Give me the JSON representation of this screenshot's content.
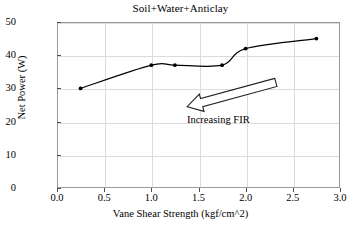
{
  "chart_data": {
    "type": "line",
    "title": "Soil+Water+Anticlay",
    "xlabel": "Vane Shear Strength (kgf/cm^2)",
    "ylabel": "Net Power (W)",
    "xlim": [
      0.0,
      3.0
    ],
    "ylim": [
      0,
      50
    ],
    "xticks": [
      "0.0",
      "0.5",
      "1.0",
      "1.5",
      "2.0",
      "2.5",
      "3.0"
    ],
    "xtick_values": [
      0.0,
      0.5,
      1.0,
      1.5,
      2.0,
      2.5,
      3.0
    ],
    "yticks": [
      "0",
      "10",
      "20",
      "30",
      "40",
      "50"
    ],
    "ytick_values": [
      0,
      10,
      20,
      30,
      40,
      50
    ],
    "grid": true,
    "legend": "none",
    "series": [
      {
        "name": "Soil+Water+Anticlay",
        "marker": "filled-circle",
        "color": "#000000",
        "x": [
          0.25,
          1.0,
          1.25,
          1.75,
          2.0,
          2.75
        ],
        "y": [
          30,
          37,
          37,
          37,
          42,
          45
        ]
      }
    ],
    "annotations": [
      {
        "text": "Increasing FIR",
        "type": "block-arrow",
        "arrow_from": [
          2.32,
          31.8
        ],
        "arrow_to": [
          1.38,
          24.5
        ],
        "label_x": 1.42,
        "label_y": 20.5
      }
    ]
  },
  "axes": {
    "tick_color": "#4d4d4d",
    "grid_color": "#dcdcdc",
    "frame_color": "#9a9a9a"
  }
}
